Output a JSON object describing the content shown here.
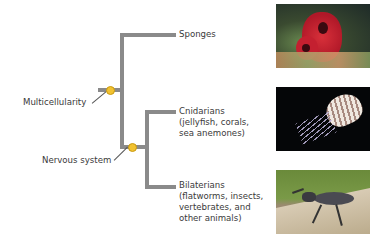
{
  "diagram": {
    "type": "phylogenetic-tree",
    "taxa": [
      {
        "name": "Sponges",
        "lines": [
          "Sponges"
        ]
      },
      {
        "name": "Cnidarians",
        "lines": [
          "Cnidarians",
          "(jellyfish, corals,",
          "sea anemones)"
        ]
      },
      {
        "name": "Bilaterians",
        "lines": [
          "Bilaterians",
          "(flatworms, insects,",
          "vertebrates, and",
          "other animals)"
        ]
      }
    ],
    "traits": [
      {
        "name": "Multicellularity"
      },
      {
        "name": "Nervous system"
      }
    ],
    "images": [
      {
        "subject": "red sponge on reef"
      },
      {
        "subject": "jellyfish on black background"
      },
      {
        "subject": "stag beetle on branch"
      }
    ],
    "colors": {
      "branch": "#8a8a8a",
      "trait_dot": "#f2c230"
    }
  }
}
